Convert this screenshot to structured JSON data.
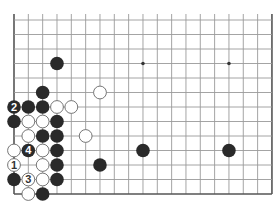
{
  "diagram": {
    "type": "go-board-partial",
    "cols": 19,
    "rows": 13,
    "origin_x": 14,
    "origin_y": 20,
    "step_x": 14.33,
    "step_y": 14.5,
    "open_top": true,
    "edges": [
      "left",
      "right",
      "bottom"
    ],
    "colors": {
      "line": "#9a9a9a",
      "edge": "#555555",
      "black": "#2a2a2a",
      "white": "#ffffff",
      "white_stroke": "#666666",
      "hoshi": "#333333"
    },
    "hoshi": [
      {
        "c": 9,
        "r": 3
      },
      {
        "c": 15,
        "r": 3
      }
    ],
    "stones": [
      {
        "c": 3,
        "r": 3,
        "color": "black"
      },
      {
        "c": 2,
        "r": 5,
        "color": "black"
      },
      {
        "c": 6,
        "r": 5,
        "color": "white"
      },
      {
        "c": 0,
        "r": 6,
        "color": "black",
        "label": "2"
      },
      {
        "c": 1,
        "r": 6,
        "color": "black"
      },
      {
        "c": 2,
        "r": 6,
        "color": "black"
      },
      {
        "c": 3,
        "r": 6,
        "color": "white"
      },
      {
        "c": 4,
        "r": 6,
        "color": "white"
      },
      {
        "c": 0,
        "r": 7,
        "color": "black"
      },
      {
        "c": 1,
        "r": 7,
        "color": "white"
      },
      {
        "c": 2,
        "r": 7,
        "color": "white"
      },
      {
        "c": 3,
        "r": 7,
        "color": "black"
      },
      {
        "c": 1,
        "r": 8,
        "color": "white"
      },
      {
        "c": 2,
        "r": 8,
        "color": "black"
      },
      {
        "c": 3,
        "r": 8,
        "color": "black"
      },
      {
        "c": 5,
        "r": 8,
        "color": "white"
      },
      {
        "c": 0,
        "r": 9,
        "color": "white"
      },
      {
        "c": 1,
        "r": 9,
        "color": "black",
        "label": "4"
      },
      {
        "c": 2,
        "r": 9,
        "color": "white"
      },
      {
        "c": 3,
        "r": 9,
        "color": "black"
      },
      {
        "c": 9,
        "r": 9,
        "color": "black"
      },
      {
        "c": 15,
        "r": 9,
        "color": "black"
      },
      {
        "c": 0,
        "r": 10,
        "color": "white",
        "label": "1"
      },
      {
        "c": 2,
        "r": 10,
        "color": "white"
      },
      {
        "c": 3,
        "r": 10,
        "color": "black"
      },
      {
        "c": 6,
        "r": 10,
        "color": "black"
      },
      {
        "c": 0,
        "r": 11,
        "color": "black"
      },
      {
        "c": 1,
        "r": 11,
        "color": "white",
        "label": "3"
      },
      {
        "c": 2,
        "r": 11,
        "color": "white"
      },
      {
        "c": 3,
        "r": 11,
        "color": "black"
      },
      {
        "c": 1,
        "r": 12,
        "color": "white"
      },
      {
        "c": 2,
        "r": 12,
        "color": "black"
      }
    ]
  }
}
